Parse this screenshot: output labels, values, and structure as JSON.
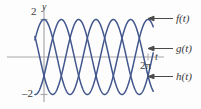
{
  "figure": {
    "axis_labels": {
      "y": "y",
      "t": "t"
    },
    "tick_labels": {
      "y_top": "2",
      "y_bottom": "–2",
      "t_right": "2π"
    },
    "legend": [
      {
        "key": "f",
        "label": "f(t)",
        "arrow": "left-arrow-icon"
      },
      {
        "key": "g",
        "label": "g(t)",
        "arrow": "left-arrow-icon"
      },
      {
        "key": "h",
        "label": "h(t)",
        "arrow": "left-arrow-icon"
      }
    ],
    "colors": {
      "curve": "#41568c",
      "axis": "#9a9a9a",
      "text": "#3a3a3a",
      "background": "#fdfdfd"
    }
  },
  "chart_data": {
    "type": "line",
    "title": "",
    "xlabel": "t",
    "ylabel": "y",
    "xlim": [
      -0.55,
      6.6
    ],
    "ylim": [
      -2.55,
      2.55
    ],
    "grid": false,
    "legend_position": "right",
    "xticks": [
      6.2832
    ],
    "xticklabels": [
      "2π"
    ],
    "yticks": [
      2,
      -2
    ],
    "yticklabels": [
      "2",
      "–2"
    ],
    "x": [
      -0.55,
      -0.4,
      -0.25,
      -0.1,
      0.0,
      0.2,
      0.4,
      0.6,
      0.8,
      1.0,
      1.2,
      1.4,
      1.57,
      1.8,
      2.0,
      2.2,
      2.4,
      2.6,
      2.8,
      3.0,
      3.14,
      3.4,
      3.6,
      3.8,
      4.0,
      4.2,
      4.4,
      4.6,
      4.71,
      5.0,
      5.2,
      5.4,
      5.6,
      5.8,
      6.0,
      6.28,
      6.6
    ],
    "series": [
      {
        "name": "f(t)",
        "formula": "2 cos(2t)",
        "amplitude": 2,
        "period": 3.1416,
        "phase": 0,
        "values": [
          1.1,
          0.58,
          -0.19,
          -0.92,
          -1.35,
          -1.93,
          -1.75,
          -0.92,
          0.17,
          1.17,
          1.86,
          2.0,
          1.94,
          1.36,
          0.43,
          -0.62,
          -1.51,
          -1.96,
          -1.8,
          -1.06,
          -0.42,
          0.86,
          1.57,
          1.95,
          1.88,
          1.37,
          0.55,
          -0.4,
          -0.9,
          -1.81,
          -1.99,
          -1.63,
          -0.85,
          0.15,
          1.09,
          2.0,
          1.2
        ]
      },
      {
        "name": "g(t)",
        "formula": "2 cos(2t - 2π/3)",
        "amplitude": 2,
        "period": 3.1416,
        "phase": -2.0944,
        "values": [
          -1.93,
          -1.99,
          -1.69,
          -1.08,
          -0.55,
          0.33,
          1.17,
          1.81,
          2.0,
          1.72,
          1.03,
          0.12,
          -0.63,
          -1.54,
          -1.96,
          -1.86,
          -1.24,
          -0.32,
          0.68,
          1.52,
          1.88,
          1.9,
          1.43,
          0.62,
          -0.38,
          -1.26,
          -1.85,
          -1.99,
          -1.91,
          -1.21,
          -0.49,
          0.45,
          1.3,
          1.88,
          1.99,
          1.0,
          -0.24
        ]
      },
      {
        "name": "h(t)",
        "formula": "2 cos(2t + 2π/3)",
        "amplitude": 2,
        "period": 3.1416,
        "phase": 2.0944,
        "values": [
          0.83,
          1.41,
          1.88,
          2.0,
          1.9,
          1.6,
          0.58,
          -0.89,
          -1.83,
          -1.99,
          -1.42,
          -0.52,
          0.23,
          1.25,
          1.85,
          1.99,
          1.63,
          0.84,
          -0.18,
          -1.1,
          -1.63,
          -1.99,
          -1.71,
          -1.07,
          -0.12,
          0.87,
          1.66,
          1.99,
          1.98,
          1.35,
          0.6,
          -0.42,
          -1.3,
          -1.86,
          -1.97,
          -1.0,
          0.25
        ]
      }
    ]
  }
}
